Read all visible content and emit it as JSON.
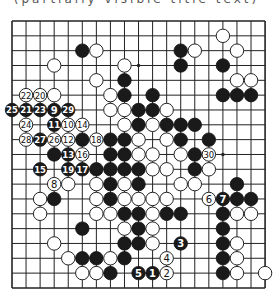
{
  "caption": "(partially visible title text)",
  "board": {
    "size": 19,
    "origin_px": {
      "x": 12,
      "y": 21
    },
    "spacing_px": {
      "x": 14.06,
      "y": 14.83
    },
    "star_points_visible": [
      [
        9,
        3
      ],
      [
        15,
        9
      ]
    ],
    "stones": [
      {
        "c": 15,
        "r": 1,
        "color": "W"
      },
      {
        "c": 5,
        "r": 2,
        "color": "B"
      },
      {
        "c": 6,
        "r": 2,
        "color": "W"
      },
      {
        "c": 12,
        "r": 2,
        "color": "B"
      },
      {
        "c": 13,
        "r": 2,
        "color": "W"
      },
      {
        "c": 16,
        "r": 2,
        "color": "W"
      },
      {
        "c": 3,
        "r": 3,
        "color": "W"
      },
      {
        "c": 8,
        "r": 3,
        "color": "W"
      },
      {
        "c": 12,
        "r": 3,
        "color": "B"
      },
      {
        "c": 15,
        "r": 3,
        "color": "B"
      },
      {
        "c": 6,
        "r": 4,
        "color": "W"
      },
      {
        "c": 8,
        "r": 4,
        "color": "B"
      },
      {
        "c": 16,
        "r": 4,
        "color": "W"
      },
      {
        "c": 17,
        "r": 4,
        "color": "W"
      },
      {
        "c": 1,
        "r": 5,
        "color": "W",
        "n": "22"
      },
      {
        "c": 2,
        "r": 5,
        "color": "W",
        "n": "20"
      },
      {
        "c": 3,
        "r": 5,
        "color": "W"
      },
      {
        "c": 7,
        "r": 5,
        "color": "W"
      },
      {
        "c": 8,
        "r": 5,
        "color": "B"
      },
      {
        "c": 10,
        "r": 5,
        "color": "B"
      },
      {
        "c": 15,
        "r": 5,
        "color": "B"
      },
      {
        "c": 16,
        "r": 5,
        "color": "B"
      },
      {
        "c": 17,
        "r": 5,
        "color": "B"
      },
      {
        "c": 0,
        "r": 6,
        "color": "B",
        "n": "25"
      },
      {
        "c": 1,
        "r": 6,
        "color": "B",
        "n": "21"
      },
      {
        "c": 2,
        "r": 6,
        "color": "B",
        "n": "23"
      },
      {
        "c": 3,
        "r": 6,
        "color": "B",
        "n": "9"
      },
      {
        "c": 4,
        "r": 6,
        "color": "B",
        "n": "29"
      },
      {
        "c": 7,
        "r": 6,
        "color": "W"
      },
      {
        "c": 8,
        "r": 6,
        "color": "W"
      },
      {
        "c": 9,
        "r": 6,
        "color": "B"
      },
      {
        "c": 10,
        "r": 6,
        "color": "B"
      },
      {
        "c": 11,
        "r": 6,
        "color": "W"
      },
      {
        "c": 1,
        "r": 7,
        "color": "W",
        "n": "24"
      },
      {
        "c": 3,
        "r": 7,
        "color": "B",
        "n": "11"
      },
      {
        "c": 4,
        "r": 7,
        "color": "W",
        "n": "10"
      },
      {
        "c": 5,
        "r": 7,
        "color": "W",
        "n": "14"
      },
      {
        "c": 8,
        "r": 7,
        "color": "W"
      },
      {
        "c": 9,
        "r": 7,
        "color": "B"
      },
      {
        "c": 10,
        "r": 7,
        "color": "W"
      },
      {
        "c": 11,
        "r": 7,
        "color": "B"
      },
      {
        "c": 12,
        "r": 7,
        "color": "B"
      },
      {
        "c": 13,
        "r": 7,
        "color": "B"
      },
      {
        "c": 1,
        "r": 8,
        "color": "W",
        "n": "28"
      },
      {
        "c": 2,
        "r": 8,
        "color": "B",
        "n": "27"
      },
      {
        "c": 3,
        "r": 8,
        "color": "W",
        "n": "26"
      },
      {
        "c": 4,
        "r": 8,
        "color": "W",
        "n": "12"
      },
      {
        "c": 5,
        "r": 8,
        "color": "B"
      },
      {
        "c": 6,
        "r": 8,
        "color": "W",
        "n": "18"
      },
      {
        "c": 7,
        "r": 8,
        "color": "B"
      },
      {
        "c": 8,
        "r": 8,
        "color": "B"
      },
      {
        "c": 9,
        "r": 8,
        "color": "W"
      },
      {
        "c": 11,
        "r": 8,
        "color": "W"
      },
      {
        "c": 12,
        "r": 8,
        "color": "B"
      },
      {
        "c": 14,
        "r": 8,
        "color": "B"
      },
      {
        "c": 3,
        "r": 9,
        "color": "B"
      },
      {
        "c": 4,
        "r": 9,
        "color": "B",
        "n": "13"
      },
      {
        "c": 5,
        "r": 9,
        "color": "W",
        "n": "16"
      },
      {
        "c": 7,
        "r": 9,
        "color": "B"
      },
      {
        "c": 8,
        "r": 9,
        "color": "B"
      },
      {
        "c": 9,
        "r": 9,
        "color": "W"
      },
      {
        "c": 10,
        "r": 9,
        "color": "W"
      },
      {
        "c": 12,
        "r": 9,
        "color": "W"
      },
      {
        "c": 13,
        "r": 9,
        "color": "B"
      },
      {
        "c": 14,
        "r": 9,
        "color": "W",
        "n": "30"
      },
      {
        "c": 2,
        "r": 10,
        "color": "B",
        "n": "15"
      },
      {
        "c": 4,
        "r": 10,
        "color": "B",
        "n": "19"
      },
      {
        "c": 5,
        "r": 10,
        "color": "B",
        "n": "17"
      },
      {
        "c": 6,
        "r": 10,
        "color": "B"
      },
      {
        "c": 7,
        "r": 10,
        "color": "B"
      },
      {
        "c": 8,
        "r": 10,
        "color": "B"
      },
      {
        "c": 9,
        "r": 10,
        "color": "B"
      },
      {
        "c": 10,
        "r": 10,
        "color": "W"
      },
      {
        "c": 11,
        "r": 10,
        "color": "W"
      },
      {
        "c": 13,
        "r": 10,
        "color": "B"
      },
      {
        "c": 14,
        "r": 10,
        "color": "W"
      },
      {
        "c": 3,
        "r": 11,
        "color": "W",
        "n": "8"
      },
      {
        "c": 4,
        "r": 11,
        "color": "W"
      },
      {
        "c": 6,
        "r": 11,
        "color": "W"
      },
      {
        "c": 7,
        "r": 11,
        "color": "B"
      },
      {
        "c": 8,
        "r": 11,
        "color": "W"
      },
      {
        "c": 9,
        "r": 11,
        "color": "B"
      },
      {
        "c": 12,
        "r": 11,
        "color": "W"
      },
      {
        "c": 13,
        "r": 11,
        "color": "W"
      },
      {
        "c": 16,
        "r": 11,
        "color": "B"
      },
      {
        "c": 2,
        "r": 12,
        "color": "W"
      },
      {
        "c": 3,
        "r": 12,
        "color": "B"
      },
      {
        "c": 6,
        "r": 12,
        "color": "W"
      },
      {
        "c": 7,
        "r": 12,
        "color": "B"
      },
      {
        "c": 8,
        "r": 12,
        "color": "W"
      },
      {
        "c": 9,
        "r": 12,
        "color": "W"
      },
      {
        "c": 10,
        "r": 12,
        "color": "W"
      },
      {
        "c": 11,
        "r": 12,
        "color": "W"
      },
      {
        "c": 14,
        "r": 12,
        "color": "W",
        "n": "6"
      },
      {
        "c": 15,
        "r": 12,
        "color": "B",
        "n": "7"
      },
      {
        "c": 16,
        "r": 12,
        "color": "B"
      },
      {
        "c": 17,
        "r": 12,
        "color": "B"
      },
      {
        "c": 2,
        "r": 13,
        "color": "W"
      },
      {
        "c": 6,
        "r": 13,
        "color": "W"
      },
      {
        "c": 7,
        "r": 13,
        "color": "W"
      },
      {
        "c": 8,
        "r": 13,
        "color": "B"
      },
      {
        "c": 9,
        "r": 13,
        "color": "B"
      },
      {
        "c": 10,
        "r": 13,
        "color": "W"
      },
      {
        "c": 11,
        "r": 13,
        "color": "B"
      },
      {
        "c": 12,
        "r": 13,
        "color": "B"
      },
      {
        "c": 15,
        "r": 13,
        "color": "B"
      },
      {
        "c": 16,
        "r": 13,
        "color": "W"
      },
      {
        "c": 17,
        "r": 13,
        "color": "W"
      },
      {
        "c": 5,
        "r": 14,
        "color": "B"
      },
      {
        "c": 8,
        "r": 14,
        "color": "W"
      },
      {
        "c": 9,
        "r": 14,
        "color": "B"
      },
      {
        "c": 10,
        "r": 14,
        "color": "W"
      },
      {
        "c": 15,
        "r": 14,
        "color": "B"
      },
      {
        "c": 3,
        "r": 15,
        "color": "W"
      },
      {
        "c": 8,
        "r": 15,
        "color": "B"
      },
      {
        "c": 9,
        "r": 15,
        "color": "B"
      },
      {
        "c": 10,
        "r": 15,
        "color": "W"
      },
      {
        "c": 12,
        "r": 15,
        "color": "B",
        "n": "3"
      },
      {
        "c": 15,
        "r": 15,
        "color": "B"
      },
      {
        "c": 16,
        "r": 15,
        "color": "W"
      },
      {
        "c": 4,
        "r": 16,
        "color": "W"
      },
      {
        "c": 5,
        "r": 16,
        "color": "B"
      },
      {
        "c": 6,
        "r": 16,
        "color": "B"
      },
      {
        "c": 7,
        "r": 16,
        "color": "W"
      },
      {
        "c": 8,
        "r": 16,
        "color": "B"
      },
      {
        "c": 11,
        "r": 16,
        "color": "W",
        "n": "4"
      },
      {
        "c": 15,
        "r": 16,
        "color": "B"
      },
      {
        "c": 16,
        "r": 16,
        "color": "W"
      },
      {
        "c": 5,
        "r": 17,
        "color": "W"
      },
      {
        "c": 6,
        "r": 17,
        "color": "W"
      },
      {
        "c": 7,
        "r": 17,
        "color": "B"
      },
      {
        "c": 9,
        "r": 17,
        "color": "B",
        "n": "5"
      },
      {
        "c": 10,
        "r": 17,
        "color": "B",
        "n": "1"
      },
      {
        "c": 11,
        "r": 17,
        "color": "W",
        "n": "2"
      },
      {
        "c": 15,
        "r": 17,
        "color": "B"
      },
      {
        "c": 16,
        "r": 17,
        "color": "W"
      },
      {
        "c": 18,
        "r": 17,
        "color": "W"
      }
    ]
  },
  "colors": {
    "black_stone": "#1a1a1a",
    "white_stone": "#ffffff",
    "grid": "#222222",
    "background": "#ffffff"
  }
}
